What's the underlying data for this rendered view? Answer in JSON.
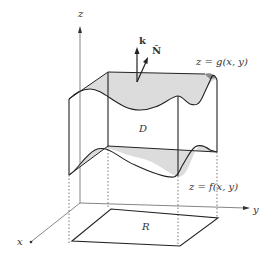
{
  "diagram": {
    "type": "3d-region-between-surfaces",
    "axes": {
      "x_label": "x",
      "y_label": "y",
      "z_label": "z"
    },
    "surfaces": {
      "top_label": "z = g(x, y)",
      "bottom_label": "z = f(x, y)"
    },
    "region_label": "D",
    "projection_label": "R",
    "vectors": {
      "k_label": "k",
      "normal_label": "N̂"
    },
    "colors": {
      "line": "#222222",
      "axis": "#555555",
      "surface_fill": "#d9d9d9",
      "surface_dark": "#9a9a9a",
      "background": "#ffffff"
    }
  }
}
